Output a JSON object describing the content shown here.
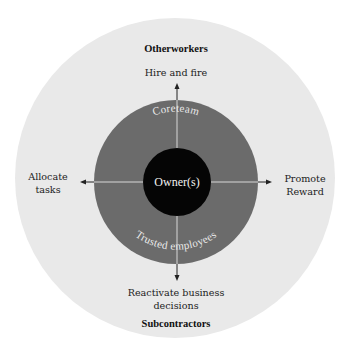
{
  "diagram": {
    "colors": {
      "background": "#ffffff",
      "outer_ring": "#e9e9e9",
      "middle_ring": "#6b6b6b",
      "core": "#050505",
      "axis_line": "#d8d8d8",
      "arrow": "#222222"
    },
    "outer_ring": {
      "top_label": "Otherworkers",
      "bottom_label": "Subcontractors"
    },
    "middle_ring": {
      "top_label": "Coreteam",
      "bottom_label": "Trusted employees"
    },
    "core": {
      "label": "Owner(s)"
    },
    "arrows": {
      "up": {
        "label": "Hire and fire"
      },
      "left": {
        "label_line1": "Allocate",
        "label_line2": "tasks"
      },
      "right": {
        "label_line1": "Promote",
        "label_line2": "Reward"
      },
      "down": {
        "label_line1": "Reactivate business",
        "label_line2": "decisions"
      }
    }
  }
}
